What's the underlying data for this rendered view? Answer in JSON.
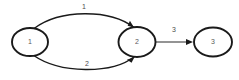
{
  "diagram": {
    "type": "directed-graph",
    "background_color": "#ffffff",
    "stroke_color": "#1a1a1a",
    "label_color": "#4d4d4d",
    "nodes": [
      {
        "id": "n1",
        "label": "1",
        "cx": 30,
        "cy": 42,
        "rx": 18,
        "ry": 14
      },
      {
        "id": "n2",
        "label": "2",
        "cx": 137,
        "cy": 42,
        "rx": 18.5,
        "ry": 15
      },
      {
        "id": "n3",
        "label": "3",
        "cx": 213,
        "cy": 42,
        "rx": 19,
        "ry": 14.5
      }
    ],
    "edges": [
      {
        "id": "e1",
        "label": "1",
        "from": "n1",
        "to": "n2",
        "shape": "curve-above",
        "label_x": 84,
        "label_y": 7,
        "path": "M 34 28.5 C 60 9, 110 9, 134 27.5",
        "arrow": {
          "x": 134,
          "y": 27.5,
          "angle": 40
        }
      },
      {
        "id": "e2",
        "label": "2",
        "from": "n1",
        "to": "n2",
        "shape": "curve-below",
        "label_x": 87,
        "label_y": 64,
        "path": "M 33 55 C 60 74, 112 74, 134 57",
        "arrow": {
          "x": 134.5,
          "y": 57,
          "angle": -40
        }
      },
      {
        "id": "e3",
        "label": "3",
        "from": "n2",
        "to": "n3",
        "shape": "straight",
        "label_x": 174,
        "label_y": 30,
        "path": "M 156 42 L 190 42",
        "arrow": {
          "x": 193,
          "y": 42,
          "angle": 0
        }
      }
    ]
  }
}
